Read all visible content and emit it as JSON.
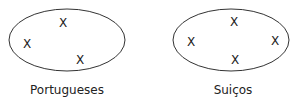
{
  "sets": [
    {
      "label": "Portugueses",
      "ellipse": {
        "cx": 67,
        "cy": 40,
        "rx": 58,
        "ry": 31
      },
      "marks": [
        {
          "symbol": "X",
          "x": 63,
          "y": 27
        },
        {
          "symbol": "X",
          "x": 27,
          "y": 48
        },
        {
          "symbol": "X",
          "x": 80,
          "y": 64
        }
      ],
      "label_pos": {
        "x": 67,
        "y": 94
      }
    },
    {
      "label": "Suiços",
      "ellipse": {
        "cx": 231,
        "cy": 40,
        "rx": 58,
        "ry": 31
      },
      "marks": [
        {
          "symbol": "X",
          "x": 234,
          "y": 26
        },
        {
          "symbol": "X",
          "x": 191,
          "y": 46
        },
        {
          "symbol": "X",
          "x": 275,
          "y": 45
        },
        {
          "symbol": "X",
          "x": 235,
          "y": 64
        }
      ],
      "label_pos": {
        "x": 233,
        "y": 94
      }
    }
  ],
  "colors": {
    "stroke": "#333333",
    "text": "#222222"
  }
}
